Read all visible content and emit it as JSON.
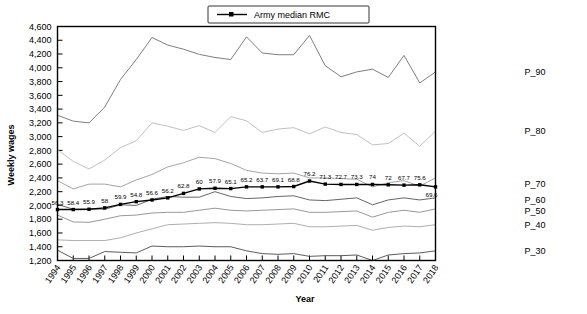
{
  "chart_data": {
    "type": "line",
    "title": "",
    "xlabel": "Year",
    "ylabel": "Weekly wages",
    "ylim": [
      1200,
      4600
    ],
    "ytick_step": 200,
    "yticks": [
      "1,200",
      "1,400",
      "1,600",
      "1,800",
      "2,000",
      "2,200",
      "2,400",
      "2,600",
      "2,800",
      "3,000",
      "3,200",
      "3,400",
      "3,600",
      "3,800",
      "4,000",
      "4,200",
      "4,400",
      "4,600"
    ],
    "grid": false,
    "legend_position": "top-center",
    "legend": [
      "Army median RMC"
    ],
    "categories": [
      1994,
      1995,
      1996,
      1997,
      1998,
      1999,
      2000,
      2001,
      2002,
      2003,
      2004,
      2005,
      2006,
      2007,
      2008,
      2009,
      2010,
      2011,
      2012,
      2013,
      2014,
      2015,
      2016,
      2017,
      2018
    ],
    "xtick_labels": [
      "1994",
      "1995",
      "1996",
      "1997",
      "1998",
      "1999",
      "2000",
      "2001",
      "2002",
      "2003",
      "2004",
      "2005",
      "2006",
      "2007",
      "2008",
      "2009",
      "2010",
      "2011",
      "2012",
      "2013",
      "2014",
      "2015",
      "2016",
      "2017",
      "2018"
    ],
    "right_labels": [
      "P_90",
      "P_80",
      "P_70",
      "P_60",
      "P_50",
      "P_40",
      "P_30"
    ],
    "series": [
      {
        "name": "P_90",
        "color": "#6f6f6f",
        "values": [
          3310,
          3225,
          3200,
          3430,
          3830,
          4120,
          4440,
          4330,
          4270,
          4195,
          4150,
          4120,
          4450,
          4215,
          4190,
          4190,
          4470,
          4030,
          3870,
          3940,
          3980,
          3860,
          4180,
          3780,
          3940
        ]
      },
      {
        "name": "P_80",
        "color": "#b9b9b9",
        "values": [
          2810,
          2640,
          2530,
          2660,
          2840,
          2940,
          3200,
          3150,
          3090,
          3160,
          3060,
          3290,
          3230,
          3060,
          3110,
          3130,
          3040,
          3140,
          3060,
          3030,
          2880,
          2900,
          3050,
          2860,
          3080
        ]
      },
      {
        "name": "P_70",
        "color": "#9a9a9a",
        "values": [
          2360,
          2240,
          2310,
          2310,
          2270,
          2370,
          2450,
          2560,
          2620,
          2700,
          2680,
          2610,
          2510,
          2470,
          2460,
          2470,
          2400,
          2400,
          2390,
          2380,
          2270,
          2330,
          2360,
          2280,
          2400
        ]
      },
      {
        "name": "P_60",
        "color": "#555555",
        "values": [
          2015,
          1945,
          1950,
          1945,
          2010,
          2000,
          2090,
          2130,
          2120,
          2120,
          2200,
          2130,
          2100,
          2110,
          2130,
          2140,
          2080,
          2070,
          2090,
          2110,
          2010,
          2080,
          2110,
          2080,
          2110
        ]
      },
      {
        "name": "P_50",
        "color": "#8c8c8c",
        "values": [
          1860,
          1760,
          1755,
          1800,
          1850,
          1860,
          1890,
          1900,
          1900,
          1930,
          1960,
          1930,
          1920,
          1930,
          1940,
          1950,
          1900,
          1900,
          1910,
          1920,
          1830,
          1900,
          1930,
          1900,
          1950
        ]
      },
      {
        "name": "P_40",
        "color": "#a5a5a5",
        "values": [
          1500,
          1490,
          1490,
          1490,
          1530,
          1600,
          1660,
          1720,
          1730,
          1740,
          1750,
          1740,
          1720,
          1720,
          1730,
          1740,
          1690,
          1690,
          1700,
          1710,
          1640,
          1680,
          1700,
          1690,
          1720
        ]
      },
      {
        "name": "P_30",
        "color": "#4a4a4a",
        "values": [
          1350,
          1230,
          1230,
          1330,
          1320,
          1310,
          1410,
          1400,
          1400,
          1410,
          1400,
          1400,
          1340,
          1300,
          1290,
          1300,
          1260,
          1270,
          1270,
          1280,
          1200,
          1280,
          1300,
          1310,
          1340
        ]
      }
    ],
    "median_series": {
      "name": "Army median RMC",
      "color": "#000000",
      "values": [
        1940,
        1940,
        1945,
        1965,
        2015,
        2055,
        2080,
        2110,
        2175,
        2240,
        2250,
        2245,
        2270,
        2270,
        2270,
        2275,
        2355,
        2310,
        2305,
        2305,
        2305,
        2300,
        2295,
        2300,
        2270
      ],
      "data_labels": [
        "56.3",
        "58.4",
        "55.9",
        "58",
        "59.9",
        "54.8",
        "56.6",
        "56.2",
        "62.8",
        "60",
        "57.9",
        "65.1",
        "65.2",
        "63.7",
        "69.1",
        "68.8",
        "76.2",
        "71.3",
        "72.7",
        "73.3",
        "74",
        "72",
        "67.7",
        "75.6",
        "69.6"
      ],
      "label_note": "percent values annotated above each marker; final 69.6 below line"
    }
  }
}
